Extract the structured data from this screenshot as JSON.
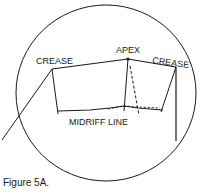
{
  "figure": {
    "caption": "Figure 5A.",
    "labels": {
      "crease_left": "CREASE",
      "apex": "APEX",
      "crease_right": "CREASE",
      "midriff": "MIDRIFF LINE"
    },
    "colors": {
      "ink": "#1a1a1a",
      "background": "#ffffff"
    }
  }
}
